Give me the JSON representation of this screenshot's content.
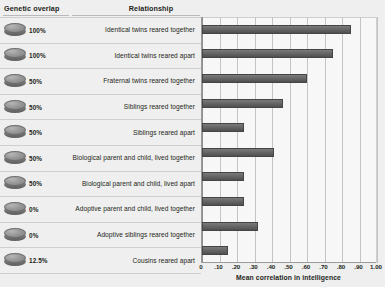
{
  "headers": {
    "genetic_overlap": "Genetic overlap",
    "relationship": "Relationship"
  },
  "axis_title": "Mean correlation in intelligence",
  "rows": [
    {
      "genetic_overlap": "100%",
      "relationship": "Identical twins reared together",
      "value": 0.85
    },
    {
      "genetic_overlap": "100%",
      "relationship": "Identical twins reared apart",
      "value": 0.75
    },
    {
      "genetic_overlap": "50%",
      "relationship": "Fraternal twins reared together",
      "value": 0.6
    },
    {
      "genetic_overlap": "50%",
      "relationship": "Siblings reared together",
      "value": 0.46
    },
    {
      "genetic_overlap": "50%",
      "relationship": "Siblings reared apart",
      "value": 0.24
    },
    {
      "genetic_overlap": "50%",
      "relationship": "Biological parent and child, lived together",
      "value": 0.41
    },
    {
      "genetic_overlap": "50%",
      "relationship": "Biological parent and child, lived apart",
      "value": 0.24
    },
    {
      "genetic_overlap": "0%",
      "relationship": "Adoptive parent and child, lived together",
      "value": 0.24
    },
    {
      "genetic_overlap": "0%",
      "relationship": "Adoptive siblings reared together",
      "value": 0.32
    },
    {
      "genetic_overlap": "12.5%",
      "relationship": "Cousins reared apart",
      "value": 0.15
    }
  ],
  "chart_data": {
    "type": "bar",
    "orientation": "horizontal",
    "title": "",
    "xlabel": "Mean correlation in intelligence",
    "ylabel": "",
    "xlim": [
      0,
      1.0
    ],
    "xticks": [
      0,
      0.1,
      0.2,
      0.3,
      0.4,
      0.5,
      0.6,
      0.7,
      0.8,
      0.9,
      1.0
    ],
    "xticklabels": [
      "0",
      ".10",
      ".20",
      ".30",
      ".40",
      ".50",
      ".60",
      ".70",
      ".80",
      ".90",
      "1.00"
    ],
    "grid": "vertical",
    "legend": "none",
    "categories": [
      "Identical twins reared together",
      "Identical twins reared apart",
      "Fraternal twins reared together",
      "Siblings reared together",
      "Siblings reared apart",
      "Biological parent and child, lived together",
      "Biological parent and child, lived apart",
      "Adoptive parent and child, lived together",
      "Adoptive siblings reared together",
      "Cousins reared apart"
    ],
    "values": [
      0.85,
      0.75,
      0.6,
      0.46,
      0.24,
      0.41,
      0.24,
      0.24,
      0.32,
      0.15
    ],
    "genetic_overlap": [
      "100%",
      "100%",
      "50%",
      "50%",
      "50%",
      "50%",
      "50%",
      "0%",
      "0%",
      "12.5%"
    ]
  },
  "colors": {
    "bar": "#5e5e5e",
    "background": "#efefef",
    "plot_background": "#f7f7f7",
    "grid": "#c4c4c4",
    "text": "#231f20"
  }
}
